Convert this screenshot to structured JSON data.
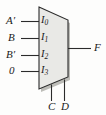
{
  "figure": {
    "kind": "multiplexer-logic-diagram",
    "body_fill": "#e9e9e6",
    "body_stroke": "#2b2b2b",
    "shadow_color": "#b9b9b4",
    "wire_color": "#2b2b2b",
    "text_color": "#1a1a1a"
  },
  "data_inputs": [
    {
      "signal": "A",
      "prime": "′",
      "signal_full": "A′",
      "port": "I",
      "port_index": "0"
    },
    {
      "signal": "B",
      "prime": "",
      "signal_full": "B",
      "port": "I",
      "port_index": "1"
    },
    {
      "signal": "B",
      "prime": "′",
      "signal_full": "B′",
      "port": "I",
      "port_index": "2"
    },
    {
      "signal": "0",
      "prime": "",
      "signal_full": "0",
      "port": "I",
      "port_index": "3"
    }
  ],
  "select_inputs": [
    {
      "label": "C"
    },
    {
      "label": "D"
    }
  ],
  "output": {
    "label": "F"
  }
}
